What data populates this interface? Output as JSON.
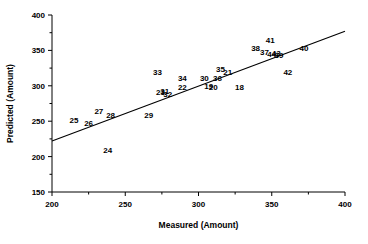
{
  "chart_data": {
    "type": "scatter",
    "title": "",
    "xlabel": "Measured (Amount)",
    "ylabel": "Predicted (Amount)",
    "xlim": [
      200,
      400
    ],
    "ylim": [
      150,
      400
    ],
    "xticks": [
      200,
      250,
      300,
      350,
      400
    ],
    "xtick_labels": [
      "200",
      "250",
      "300",
      "350",
      "400"
    ],
    "yticks": [
      150,
      200,
      250,
      300,
      350,
      400
    ],
    "ytick_labels": [
      "150",
      "200",
      "250",
      "300",
      "350",
      "400"
    ],
    "xminor_ticks": [
      225,
      275,
      325,
      375
    ],
    "yminor_ticks": [
      175,
      225,
      275,
      325,
      375
    ],
    "grid": false,
    "legend": false,
    "marker_style": "numeric-label",
    "line": {
      "type": "regression",
      "x": [
        200,
        400
      ],
      "y": [
        222,
        377
      ],
      "color": "#000000"
    },
    "points": [
      {
        "label": "25",
        "x": 215,
        "y": 251
      },
      {
        "label": "26",
        "x": 225,
        "y": 248
      },
      {
        "label": "27",
        "x": 232,
        "y": 264
      },
      {
        "label": "28",
        "x": 240,
        "y": 259
      },
      {
        "label": "24",
        "x": 238,
        "y": 209
      },
      {
        "label": "29",
        "x": 266,
        "y": 259
      },
      {
        "label": "23",
        "x": 274,
        "y": 291
      },
      {
        "label": "31",
        "x": 277,
        "y": 292
      },
      {
        "label": "32",
        "x": 279,
        "y": 288
      },
      {
        "label": "33",
        "x": 272,
        "y": 320
      },
      {
        "label": "34",
        "x": 289,
        "y": 311
      },
      {
        "label": "22",
        "x": 289,
        "y": 299
      },
      {
        "label": "30",
        "x": 304,
        "y": 311
      },
      {
        "label": "36",
        "x": 313,
        "y": 311
      },
      {
        "label": "35",
        "x": 315,
        "y": 324
      },
      {
        "label": "21",
        "x": 320,
        "y": 319
      },
      {
        "label": "19",
        "x": 307,
        "y": 300
      },
      {
        "label": "20",
        "x": 310,
        "y": 298
      },
      {
        "label": "18",
        "x": 328,
        "y": 299
      },
      {
        "label": "38",
        "x": 339,
        "y": 353
      },
      {
        "label": "41",
        "x": 349,
        "y": 364
      },
      {
        "label": "37",
        "x": 345,
        "y": 348
      },
      {
        "label": "44",
        "x": 350,
        "y": 345
      },
      {
        "label": "43",
        "x": 353,
        "y": 346
      },
      {
        "label": "39",
        "x": 355,
        "y": 344
      },
      {
        "label": "40",
        "x": 372,
        "y": 354
      },
      {
        "label": "42",
        "x": 361,
        "y": 320
      }
    ]
  }
}
